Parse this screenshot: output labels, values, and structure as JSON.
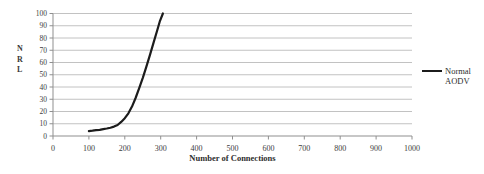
{
  "figure": {
    "background": "#ffffff"
  },
  "chart_data": {
    "type": "line",
    "title": "",
    "xlabel": "Number of Connections",
    "ylabel": "NRL",
    "ylabel_letters": [
      "N",
      "R",
      "L"
    ],
    "xlim": [
      0,
      1000
    ],
    "ylim": [
      0,
      100
    ],
    "xticks": [
      0,
      100,
      200,
      300,
      400,
      500,
      600,
      700,
      800,
      900,
      1000
    ],
    "yticks": [
      0,
      10,
      20,
      30,
      40,
      50,
      60,
      70,
      80,
      90,
      100
    ],
    "grid": "horizontal",
    "legend_position": "right-outside",
    "series": [
      {
        "name": "Normal AODV",
        "legend_lines": [
          "Normal",
          "AODV"
        ],
        "color": "#1c1c1c",
        "points": [
          [
            100,
            4
          ],
          [
            110,
            4.3
          ],
          [
            120,
            4.7
          ],
          [
            130,
            5.1
          ],
          [
            140,
            5.6
          ],
          [
            150,
            6.1
          ],
          [
            160,
            6.8
          ],
          [
            170,
            7.7
          ],
          [
            180,
            9
          ],
          [
            190,
            11.5
          ],
          [
            200,
            14.5
          ],
          [
            210,
            18.5
          ],
          [
            220,
            24
          ],
          [
            230,
            31
          ],
          [
            240,
            39
          ],
          [
            250,
            47.5
          ],
          [
            260,
            56.5
          ],
          [
            270,
            66
          ],
          [
            280,
            76
          ],
          [
            290,
            86
          ],
          [
            298,
            94
          ],
          [
            306,
            100
          ]
        ]
      }
    ],
    "colors": {
      "gridline": "#c2c2c2",
      "axis": "#8f8f8f",
      "tick_label": "#3d3d3d",
      "axis_label": "#2e2e2e",
      "line": "#1c1c1c"
    }
  }
}
